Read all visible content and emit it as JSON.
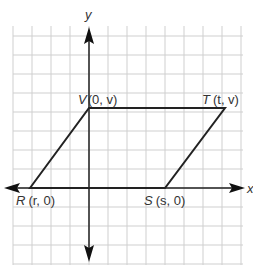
{
  "diagram": {
    "type": "coordinate-plane-parallelogram",
    "axes": {
      "x_label": "x",
      "y_label": "y"
    },
    "grid": {
      "origin_px": [
        89,
        188
      ],
      "spacing_px": 19,
      "x_range_px": [
        13,
        243
      ],
      "y_range_px": [
        26,
        265
      ],
      "color": "#cfcfcf"
    },
    "vertices": [
      {
        "name": "V",
        "label": "V",
        "coords": "(0, v)",
        "px": [
          89,
          108
        ]
      },
      {
        "name": "T",
        "label": "T",
        "coords": "(t, v)",
        "px": [
          225,
          108
        ]
      },
      {
        "name": "S",
        "label": "S",
        "coords": "(s, 0)",
        "px": [
          165,
          188
        ]
      },
      {
        "name": "R",
        "label": "R",
        "coords": "(r, 0)",
        "px": [
          30,
          188
        ]
      }
    ],
    "colors": {
      "axis": "#222222",
      "shape": "#222222",
      "label": "#555555"
    }
  }
}
